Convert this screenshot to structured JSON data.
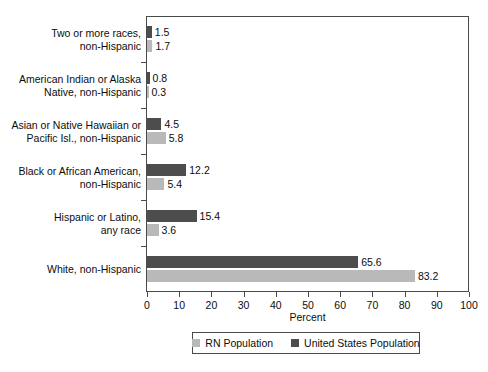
{
  "chart_data": {
    "type": "bar",
    "orientation": "horizontal",
    "title": "",
    "xlabel": "Percent",
    "ylabel": "",
    "xlim": [
      0,
      100
    ],
    "xticks": [
      0,
      10,
      20,
      30,
      40,
      50,
      60,
      70,
      80,
      90,
      100
    ],
    "xtick_labels": [
      "0",
      "10",
      "20",
      "30",
      "40",
      "50",
      "60",
      "70",
      "80",
      "90",
      "100"
    ],
    "grid": false,
    "legend_position": "bottom",
    "categories": [
      "Two or more races,\nnon-Hispanic",
      "American Indian or Alaska\nNative, non-Hispanic",
      "Asian or Native Hawaiian or\nPacific Isl., non-Hispanic",
      "Black or African American,\nnon-Hispanic",
      "Hispanic or Latino,\nany race",
      "White, non-Hispanic"
    ],
    "series": [
      {
        "name": "United States Population",
        "color": "#4d4d4d",
        "values": [
          1.5,
          0.8,
          4.5,
          12.2,
          15.4,
          65.6
        ],
        "value_labels": [
          "1.5",
          "0.8",
          "4.5",
          "12.2",
          "15.4",
          "65.6"
        ]
      },
      {
        "name": "RN Population",
        "color": "#b9b9b9",
        "values": [
          1.7,
          0.3,
          5.8,
          5.4,
          3.6,
          83.2
        ],
        "value_labels": [
          "1.7",
          "0.3",
          "5.8",
          "5.4",
          "3.6",
          "83.2"
        ]
      }
    ],
    "legend": [
      {
        "label": "RN Population",
        "color": "#b9b9b9",
        "swatch": "legend-swatch-rn"
      },
      {
        "label": "United States Population",
        "color": "#4d4d4d",
        "swatch": "legend-swatch-us"
      }
    ]
  }
}
